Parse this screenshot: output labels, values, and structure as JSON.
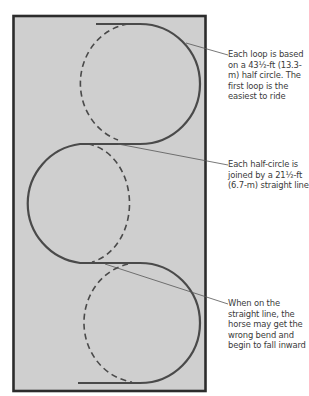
{
  "diagram": {
    "type": "serpentine-riding-figure",
    "arena_fill": "#cfcfcf",
    "frame_color": "#2c2c2c",
    "track_color": "#4a4a4a",
    "leader_color": "#555555",
    "loops": [
      {
        "position": "top",
        "side": "right"
      },
      {
        "position": "middle",
        "side": "left"
      },
      {
        "position": "bottom",
        "side": "right"
      }
    ],
    "callouts": [
      {
        "id": "loop-size",
        "text": "Each loop is based on a 43½-ft (13.3-m) half circle. The first loop is the easiest to ride"
      },
      {
        "id": "straight-line",
        "text": "Each half-circle is joined by a 21½-ft (6.7-m) straight line"
      },
      {
        "id": "wrong-bend",
        "text": "When on the straight line, the horse may get the wrong bend and begin to fall inward"
      }
    ]
  }
}
